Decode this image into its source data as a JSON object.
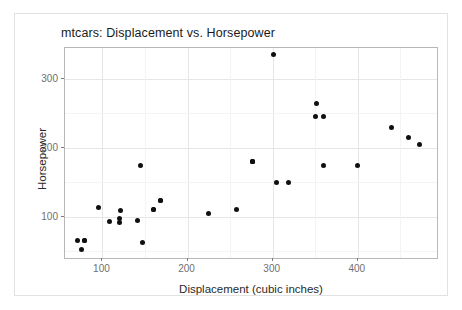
{
  "chart_data": {
    "type": "scatter",
    "title": "mtcars: Displacement vs. Horsepower",
    "xlabel": "Displacement (cubic inches)",
    "ylabel": "Horsepower",
    "xlim": [
      56,
      493
    ],
    "ylim": [
      40,
      345
    ],
    "xticks": [
      100,
      200,
      300,
      400
    ],
    "yticks": [
      100,
      200,
      300
    ],
    "xtick_labels": [
      "100",
      "200",
      "300",
      "400"
    ],
    "ytick_labels": [
      "100",
      "200",
      "300"
    ],
    "grid": true,
    "legend": null,
    "point_color": "#101010",
    "panel_border_color": "#b7b7b7",
    "grid_color": "#e6e6e6",
    "series": [
      {
        "name": "mtcars",
        "x": [
          160,
          160,
          108,
          258,
          360,
          225,
          360,
          146.7,
          140.8,
          167.6,
          167.6,
          275.8,
          275.8,
          275.8,
          472,
          460,
          440,
          78.7,
          75.7,
          71.1,
          120.1,
          318,
          304,
          350,
          400,
          79,
          120.3,
          95.1,
          351,
          145,
          301,
          121
        ],
        "y": [
          110,
          110,
          93,
          110,
          175,
          105,
          245,
          62,
          95,
          123,
          123,
          180,
          180,
          180,
          205,
          215,
          230,
          66,
          52,
          65,
          97,
          150,
          150,
          245,
          175,
          66,
          91,
          113,
          264,
          175,
          335,
          109
        ]
      }
    ]
  }
}
